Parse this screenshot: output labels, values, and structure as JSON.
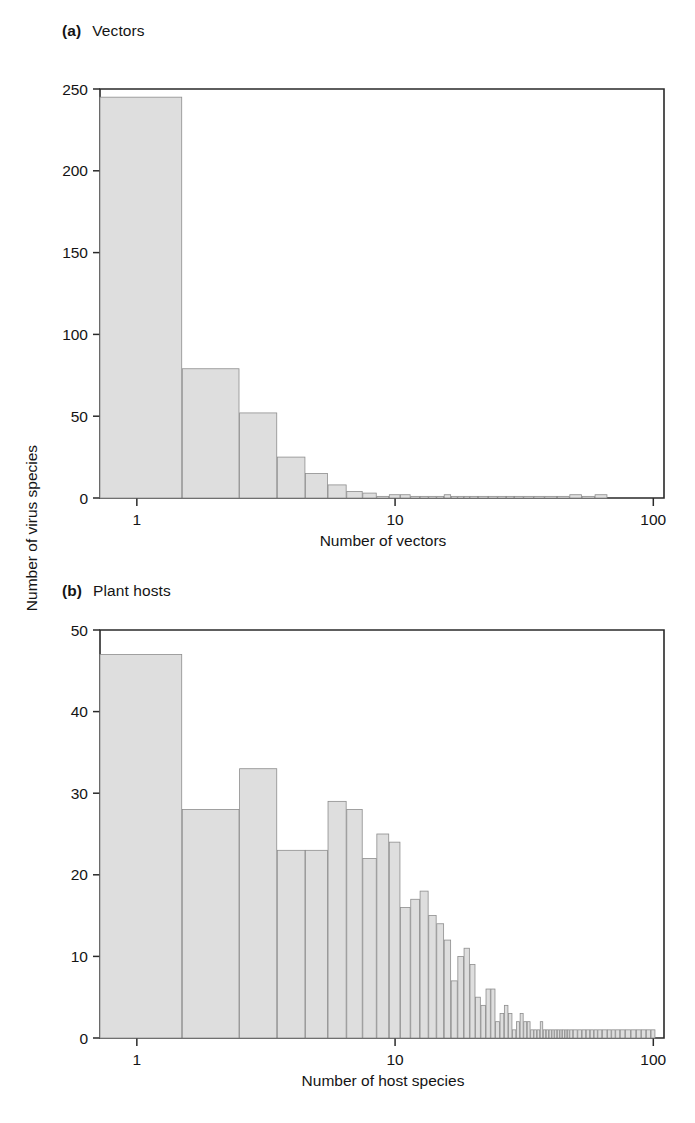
{
  "figure": {
    "shared_ylabel": "Number of virus species",
    "panels": [
      "a",
      "b"
    ]
  },
  "panel_a": {
    "tag": "(a)",
    "title": "Vectors",
    "xlabel": "Number of vectors",
    "ylabel": "Number of virus species",
    "ytick_labels": [
      "0",
      "50",
      "100",
      "150",
      "200",
      "250"
    ],
    "xtick_labels": [
      "1",
      "10",
      "100"
    ]
  },
  "panel_b": {
    "tag": "(b)",
    "title": "Plant hosts",
    "xlabel": "Number of host species",
    "ylabel": "Number of virus species",
    "ytick_labels": [
      "0",
      "10",
      "20",
      "30",
      "40",
      "50"
    ],
    "xtick_labels": [
      "1",
      "10",
      "100"
    ]
  },
  "colors": {
    "bar_fill": "#dedede",
    "bar_stroke": "#8d8d8d",
    "axis": "#2a2a2a",
    "text": "#141414",
    "background": "#ffffff"
  },
  "chart_data": [
    {
      "type": "bar",
      "panel": "a",
      "title": "(a) Vectors",
      "xlabel": "Number of vectors",
      "ylabel": "Number of virus species",
      "xscale": "log",
      "xlim": [
        0.72,
        110
      ],
      "ylim": [
        0,
        250
      ],
      "yticks": [
        0,
        50,
        100,
        150,
        200,
        250
      ],
      "xticks": [
        1,
        10,
        100
      ],
      "grid": false,
      "legend": false,
      "x": [
        1,
        2,
        3,
        4,
        5,
        6,
        7,
        8,
        9,
        10,
        11,
        12,
        13,
        14,
        15,
        16,
        17,
        18,
        19,
        20,
        22,
        24,
        26,
        28,
        30,
        33,
        36,
        40,
        45,
        50,
        56,
        63
      ],
      "values": [
        245,
        79,
        52,
        25,
        15,
        8,
        4,
        3,
        1,
        2,
        2,
        1,
        1,
        1,
        1,
        2,
        1,
        1,
        1,
        1,
        1,
        1,
        1,
        1,
        1,
        1,
        1,
        1,
        1,
        2,
        1,
        2
      ]
    },
    {
      "type": "bar",
      "panel": "b",
      "title": "(b) Plant hosts",
      "xlabel": "Number of host species",
      "ylabel": "Number of virus species",
      "xscale": "log",
      "xlim": [
        0.72,
        110
      ],
      "ylim": [
        0,
        50
      ],
      "yticks": [
        0,
        10,
        20,
        30,
        40,
        50
      ],
      "xticks": [
        1,
        10,
        100
      ],
      "grid": false,
      "legend": false,
      "x": [
        1,
        2,
        3,
        4,
        5,
        6,
        7,
        8,
        9,
        10,
        11,
        12,
        13,
        14,
        15,
        16,
        17,
        18,
        19,
        20,
        21,
        22,
        23,
        24,
        25,
        26,
        27,
        28,
        29,
        30,
        31,
        32,
        33,
        34,
        35,
        36,
        37,
        38,
        39,
        40,
        41,
        42,
        43,
        44,
        45,
        46,
        47,
        48,
        50,
        52,
        54,
        56,
        58,
        60,
        62,
        65,
        68,
        70,
        73,
        76,
        80,
        84,
        88,
        92,
        96,
        100
      ],
      "values": [
        47,
        28,
        33,
        23,
        23,
        29,
        28,
        22,
        25,
        24,
        16,
        17,
        18,
        15,
        14,
        12,
        7,
        10,
        11,
        9,
        5,
        4,
        6,
        6,
        2,
        3,
        4,
        3,
        1,
        2,
        3,
        2,
        2,
        1,
        1,
        1,
        2,
        1,
        1,
        1,
        1,
        1,
        1,
        1,
        1,
        1,
        1,
        1,
        1,
        1,
        1,
        1,
        1,
        1,
        1,
        1,
        1,
        1,
        1,
        1,
        1,
        1,
        1,
        1,
        1,
        1
      ]
    }
  ]
}
